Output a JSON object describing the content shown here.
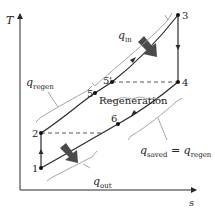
{
  "diagram": {
    "axes": {
      "y_label": "T",
      "x_label": "s"
    },
    "points": {
      "p1": "1",
      "p2": "2",
      "p3": "3",
      "p4": "4",
      "p5": "5",
      "p5p": "5'",
      "p6": "6"
    },
    "labels": {
      "q_in": "q",
      "q_in_sub": "in",
      "q_out": "q",
      "q_out_sub": "out",
      "q_regen": "q",
      "q_regen_sub": "regen",
      "regeneration": "Regeneration",
      "q_saved": "q",
      "q_saved_sub": "saved",
      "equals": " = ",
      "q_saved_rhs": "q",
      "q_saved_rhs_sub": "regen"
    },
    "colors": {
      "line": "#2a2a2a",
      "arrow_fill": "#4a4a4a",
      "bracket": "#9a9a9a"
    }
  }
}
